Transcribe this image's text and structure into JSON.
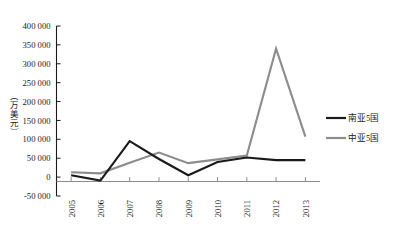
{
  "chart_data": {
    "type": "line",
    "title": "",
    "xlabel": "",
    "ylabel": "（万美元）",
    "categories": [
      "2005",
      "2006",
      "2007",
      "2008",
      "2009",
      "2010",
      "2011",
      "2012",
      "2013"
    ],
    "ylim": [
      -50000,
      400000
    ],
    "ytick_labels": [
      "400 000",
      "350 000",
      "300 000",
      "250 000",
      "200 000",
      "150 000",
      "100 000",
      "50 000",
      "0",
      "-50 000"
    ],
    "ytick_values": [
      400000,
      350000,
      300000,
      250000,
      200000,
      150000,
      100000,
      50000,
      0,
      -50000
    ],
    "grid": false,
    "legend_position": "right",
    "series": [
      {
        "name": "南亚5国",
        "color": "#1a1a1a",
        "values": [
          5000,
          -9000,
          95000,
          48000,
          5000,
          40000,
          52000,
          45000,
          45000
        ]
      },
      {
        "name": "中亚5国",
        "color": "#8c8c8c",
        "values": [
          13000,
          10000,
          38000,
          65000,
          37000,
          47000,
          57000,
          340000,
          107000
        ]
      }
    ]
  },
  "legend": {
    "items": [
      {
        "label": "南亚5国",
        "color": "#1a1a1a"
      },
      {
        "label": "中亚5国",
        "color": "#8c8c8c"
      }
    ]
  }
}
